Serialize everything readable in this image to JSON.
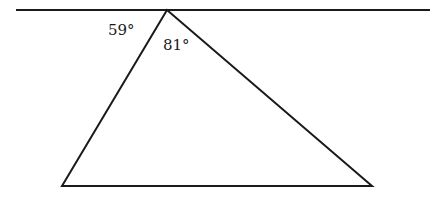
{
  "diagram": {
    "type": "geometry-triangle",
    "line": {
      "x1": 16,
      "y1": 10,
      "x2": 430,
      "y2": 10
    },
    "triangle": {
      "apex": {
        "x": 167,
        "y": 10
      },
      "bottom_left": {
        "x": 62,
        "y": 186
      },
      "bottom_right": {
        "x": 372,
        "y": 186
      }
    },
    "labels": {
      "outer_angle": "59°",
      "apex_angle": "81°"
    },
    "stroke_color": "#1a1a1a"
  }
}
